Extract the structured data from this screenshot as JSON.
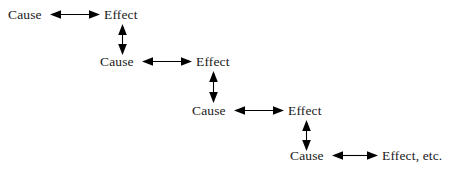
{
  "diagram": {
    "type": "cause-effect-cascade",
    "title": "",
    "background_color": "#ffffff",
    "text_color": "#1a1a1a",
    "arrow_color": "#000000",
    "arrow_style": "double-headed",
    "rows": [
      {
        "cause_label": "Cause",
        "effect_label": "Effect",
        "cause_x": 8,
        "effect_x": 104,
        "y": 8,
        "h_arrow": {
          "x": 50,
          "y": 8,
          "width": 50
        },
        "v_arrow": {
          "x": 116,
          "y": 24,
          "height": 31,
          "present": true
        }
      },
      {
        "cause_label": "Cause",
        "effect_label": "Effect",
        "cause_x": 100,
        "effect_x": 196,
        "y": 55,
        "h_arrow": {
          "x": 142,
          "y": 55,
          "width": 50
        },
        "v_arrow": {
          "x": 207,
          "y": 71,
          "height": 32,
          "present": true
        }
      },
      {
        "cause_label": "Cause",
        "effect_label": "Effect",
        "cause_x": 192,
        "effect_x": 288,
        "y": 104,
        "h_arrow": {
          "x": 234,
          "y": 104,
          "width": 50
        },
        "v_arrow": {
          "x": 300,
          "y": 120,
          "height": 31,
          "present": true
        }
      },
      {
        "cause_label": "Cause",
        "effect_label": "Effect, etc.",
        "cause_x": 290,
        "effect_x": 382,
        "y": 149,
        "h_arrow": {
          "x": 332,
          "y": 149,
          "width": 46
        },
        "v_arrow": {
          "x": 0,
          "y": 0,
          "height": 0,
          "present": false
        }
      }
    ]
  }
}
